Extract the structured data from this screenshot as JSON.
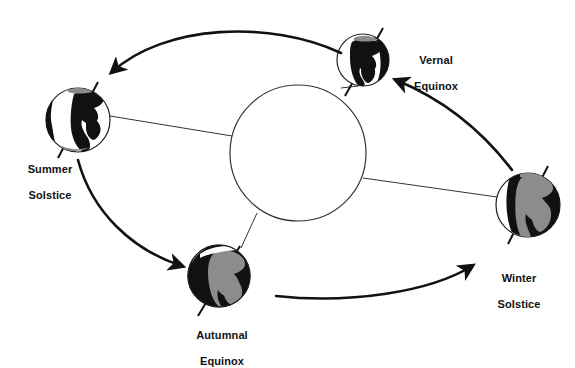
{
  "diagram": {
    "colors": {
      "ink": "#111111",
      "line": "#222222",
      "continent_dark": "#111111",
      "continent_gray": "#8c8c8c",
      "shadow": "#111111",
      "lit": "#ffffff",
      "background": "#ffffff"
    },
    "sun": {
      "name": "sun",
      "cx": 298,
      "cy": 153,
      "r": 68,
      "fill": "#ffffff",
      "stroke": "#333333"
    },
    "orbit": {
      "name": "orbital-path",
      "cx": 298,
      "cy": 176,
      "rx": 228,
      "ry": 136,
      "rotation": -4
    },
    "positions": [
      {
        "id": "summer-solstice",
        "label": "Summer\nSolstice",
        "label_line1": "Summer",
        "label_line2": "Solstice",
        "cx": 78,
        "cy": 120,
        "r": 32,
        "axis_tilt_deg": -23.5,
        "lit_side": "right",
        "label_x": 8,
        "label_y": 150
      },
      {
        "id": "vernal-equinox",
        "label": "Vernal\nEquinox",
        "label_line1": "Vernal",
        "label_line2": "Equinox",
        "cx": 363,
        "cy": 60,
        "r": 26,
        "axis_tilt_deg": -23.5,
        "lit_side": "left",
        "label_x": 395,
        "label_y": 41
      },
      {
        "id": "winter-solstice",
        "label": "Winter\nSolstice",
        "label_line1": "Winter",
        "label_line2": "Solstice",
        "cx": 528,
        "cy": 205,
        "r": 32,
        "axis_tilt_deg": -23.5,
        "lit_side": "left",
        "label_x": 479,
        "label_y": 259
      },
      {
        "id": "autumnal-equinox",
        "label": "Autumnal\nEquinox",
        "label_line1": "Autumnal",
        "label_line2": "Equinox",
        "cx": 219,
        "cy": 276,
        "r": 31,
        "axis_tilt_deg": -23.5,
        "lit_side": "right",
        "label_x": 172,
        "label_y": 316
      }
    ],
    "direction_arrows": [
      {
        "id": "arrow-vernal-to-summer",
        "from": "vernal-equinox",
        "to": "summer-solstice",
        "direction": "counterclockwise"
      },
      {
        "id": "arrow-summer-to-autumnal",
        "from": "summer-solstice",
        "to": "autumnal-equinox",
        "direction": "counterclockwise"
      },
      {
        "id": "arrow-autumnal-to-winter",
        "from": "autumnal-equinox",
        "to": "winter-solstice",
        "direction": "counterclockwise"
      },
      {
        "id": "arrow-winter-to-vernal",
        "from": "winter-solstice",
        "to": "vernal-equinox",
        "direction": "counterclockwise"
      }
    ],
    "sun_rays": [
      {
        "id": "ray-to-summer",
        "target": "summer-solstice"
      },
      {
        "id": "ray-to-vernal",
        "target": "vernal-equinox"
      },
      {
        "id": "ray-to-winter",
        "target": "winter-solstice"
      },
      {
        "id": "ray-to-autumnal",
        "target": "autumnal-equinox"
      }
    ]
  }
}
